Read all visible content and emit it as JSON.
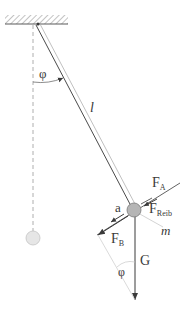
{
  "diagram": {
    "labels": {
      "angle_top": "φ",
      "length": "l",
      "force_a": "F",
      "force_a_sub": "A",
      "accel": "a",
      "force_friction": "F",
      "force_friction_sub": "Reib",
      "force_b": "F",
      "force_b_sub": "B",
      "mass": "m",
      "gravity": "G",
      "angle_bottom": "φ"
    },
    "colors": {
      "line": "#4a4a4a",
      "light_line": "#bdbdbd",
      "bob_fill": "#b5b5b5",
      "rest_bob_fill": "#e6e6e6",
      "hatch": "#9a9a9a"
    }
  }
}
